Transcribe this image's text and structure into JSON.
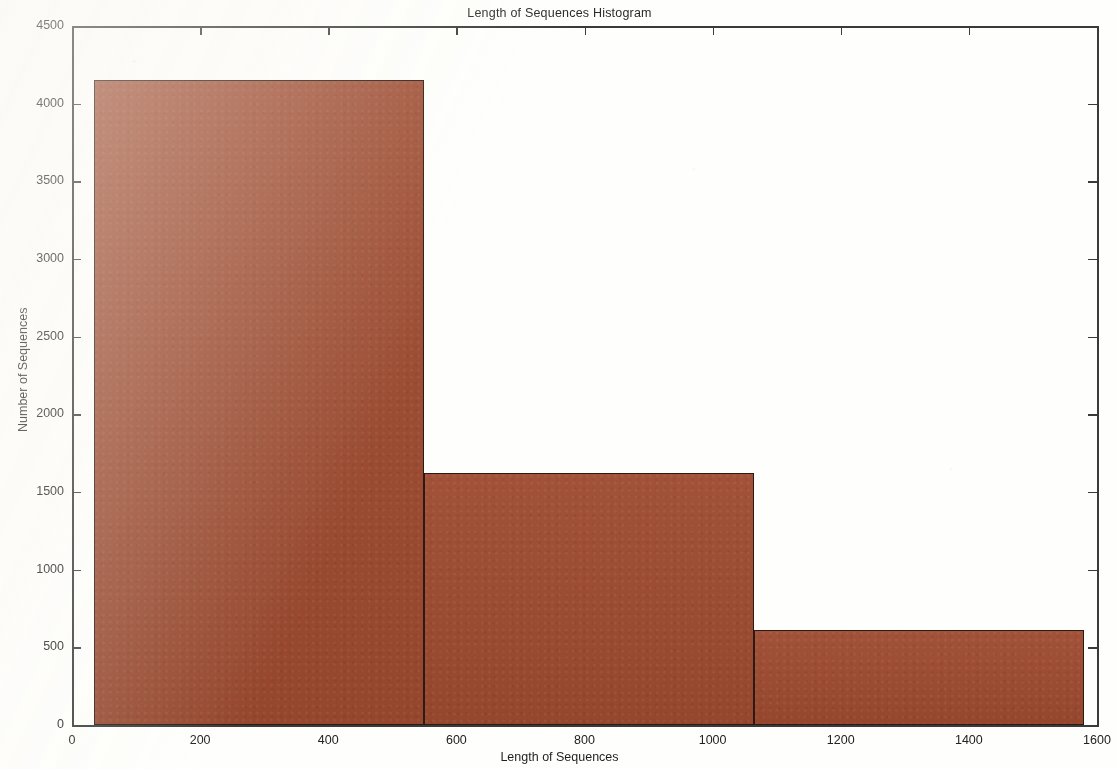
{
  "chart_data": {
    "type": "bar",
    "title": "Length of Sequences Histogram",
    "xlabel": "Length of Sequences",
    "ylabel": "Number of Sequences",
    "xlim": [
      0,
      1600
    ],
    "ylim": [
      0,
      4500
    ],
    "xticks": [
      0,
      200,
      400,
      600,
      800,
      1000,
      1200,
      1400,
      1600
    ],
    "ytticks_note": "y ticks every 500",
    "yticks": [
      0,
      500,
      1000,
      1500,
      2000,
      2500,
      3000,
      3500,
      4000,
      4500
    ],
    "grid": false,
    "legend": null,
    "bar_color": "#9d4a2f",
    "bar_edge_color": "#2c1b14",
    "bins": [
      {
        "x_start": 35,
        "x_end": 550,
        "value": 4150
      },
      {
        "x_start": 550,
        "x_end": 1065,
        "value": 1625
      },
      {
        "x_start": 1065,
        "x_end": 1580,
        "value": 610
      }
    ],
    "categories": [
      "35-550",
      "550-1065",
      "1065-1580"
    ],
    "values": [
      4150,
      1625,
      610
    ]
  },
  "axes": {
    "y_tick_labels": [
      "4500",
      "4000",
      "3500",
      "3000",
      "2500",
      "2000",
      "1500",
      "1000",
      "500",
      "0"
    ],
    "x_tick_labels": [
      "0",
      "200",
      "400",
      "600",
      "800",
      "1000",
      "1200",
      "1400",
      "1600"
    ]
  }
}
